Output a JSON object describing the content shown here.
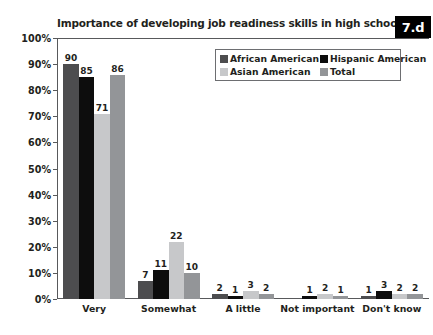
{
  "badge": {
    "label": "7.d"
  },
  "chart_data": {
    "type": "bar",
    "title": "Importance of developing job readiness skills in high school?",
    "xlabel": "",
    "ylabel": "",
    "ylim": [
      0,
      100
    ],
    "grid": false,
    "legend_position": "top-right",
    "value_suffix": "",
    "categories": [
      "Very",
      "Somewhat",
      "A little",
      "Not important",
      "Don't know"
    ],
    "ytick_labels": [
      "0%",
      "10%",
      "20%",
      "30%",
      "40%",
      "50%",
      "60%",
      "70%",
      "80%",
      "90%",
      "100%"
    ],
    "ytick_values": [
      0,
      10,
      20,
      30,
      40,
      50,
      60,
      70,
      80,
      90,
      100
    ],
    "series": [
      {
        "name": "African American",
        "color": "#4d4d4f",
        "values": [
          90,
          7,
          2,
          0,
          1
        ]
      },
      {
        "name": "Hispanic American",
        "color": "#0d0d0d",
        "values": [
          85,
          11,
          1,
          1,
          3
        ]
      },
      {
        "name": "Asian American",
        "color": "#c7c8ca",
        "values": [
          71,
          22,
          3,
          2,
          2
        ]
      },
      {
        "name": "Total",
        "color": "#939598",
        "values": [
          86,
          10,
          2,
          1,
          2
        ]
      }
    ],
    "labels": [
      [
        "90",
        "85",
        "71",
        "86"
      ],
      [
        "7",
        "11",
        "22",
        "10"
      ],
      [
        "2",
        "1",
        "3",
        "2"
      ],
      [
        "",
        "1",
        "2",
        "1"
      ],
      [
        "1",
        "3",
        "2",
        "2"
      ]
    ]
  }
}
